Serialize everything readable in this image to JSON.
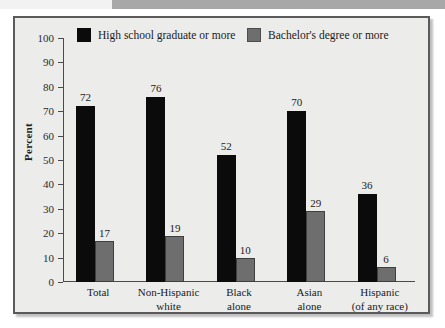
{
  "top_strip": {
    "name": "page-edge-strip"
  },
  "chart_data": {
    "type": "bar",
    "title": "",
    "subtitle": "",
    "xlabel": "",
    "ylabel": "Percent",
    "ylim": [
      0,
      100
    ],
    "ytick_step": 10,
    "yticks": [
      "100",
      "90",
      "80",
      "70",
      "60",
      "50",
      "40",
      "30",
      "20",
      "10",
      "0"
    ],
    "grid": false,
    "legend_position": "top",
    "categories": [
      [
        "Total"
      ],
      [
        "Non-Hispanic",
        "white"
      ],
      [
        "Black",
        "alone"
      ],
      [
        "Asian",
        "alone"
      ],
      [
        "Hispanic",
        "(of any race)"
      ]
    ],
    "series": [
      {
        "name": "High school graduate or more",
        "color": "#0b0b0b",
        "values": [
          72,
          76,
          52,
          70,
          36
        ]
      },
      {
        "name": "Bachelor's degree or more",
        "color": "#6e6e6e",
        "values": [
          17,
          19,
          10,
          29,
          6
        ]
      }
    ]
  }
}
